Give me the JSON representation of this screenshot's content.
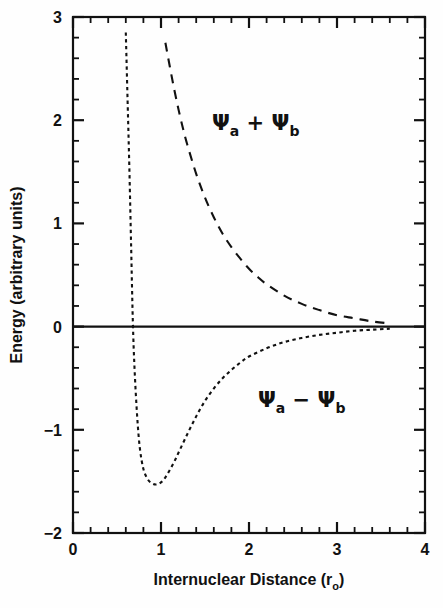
{
  "chart_data": {
    "type": "line",
    "title": "",
    "xlabel": "Internuclear Distance (r",
    "xlabel_sub": "o",
    "xlabel_tail": ")",
    "ylabel": "Energy (arbitrary units)",
    "xlim": [
      0,
      4
    ],
    "ylim": [
      -2,
      3
    ],
    "xticks": [
      "0",
      "1",
      "2",
      "3",
      "4"
    ],
    "xtick_values": [
      0,
      1,
      2,
      3,
      4
    ],
    "yticks": [
      "3",
      "2",
      "1",
      "0",
      "−1",
      "−2"
    ],
    "ytick_values": [
      3,
      2,
      1,
      0,
      -1,
      -2
    ],
    "minor_tick_step": 0.2,
    "grid": false,
    "legend": "none",
    "zero_line": 0,
    "annotations": [
      {
        "id": "antibonding-label",
        "text_psi": "Ψ",
        "sub_a": "a",
        "operator": "+",
        "sub_b": "b",
        "full_text": "Ψa + Ψb",
        "x": 2.0,
        "y": 2.05
      },
      {
        "id": "bonding-label",
        "text_psi": "Ψ",
        "sub_a": "a",
        "operator": "−",
        "sub_b": "b",
        "full_text": "Ψa − Ψb",
        "x": 2.55,
        "y": -1.02
      }
    ],
    "series": [
      {
        "name": "Ψa + Ψb",
        "style": "dashed-long",
        "description": "antibonding molecular orbital energy curve, repulsive, monotonically decreasing toward zero",
        "x": [
          1.05,
          1.1,
          1.15,
          1.2,
          1.25,
          1.3,
          1.4,
          1.5,
          1.6,
          1.7,
          1.8,
          1.9,
          2.0,
          2.1,
          2.2,
          2.4,
          2.6,
          2.8,
          3.0,
          3.2,
          3.4,
          3.6
        ],
        "y": [
          2.75,
          2.52,
          2.3,
          2.1,
          1.92,
          1.76,
          1.48,
          1.25,
          1.06,
          0.9,
          0.77,
          0.66,
          0.56,
          0.48,
          0.41,
          0.3,
          0.22,
          0.16,
          0.11,
          0.08,
          0.05,
          0.03
        ]
      },
      {
        "name": "Ψa − Ψb",
        "style": "dotted-short",
        "description": "bonding molecular orbital energy curve, Morse-like potential well with minimum at r = 1.0 r0",
        "x": [
          0.6,
          0.62,
          0.64,
          0.66,
          0.68,
          0.7,
          0.73,
          0.76,
          0.8,
          0.85,
          0.9,
          0.95,
          1.0,
          1.05,
          1.1,
          1.15,
          1.2,
          1.3,
          1.4,
          1.5,
          1.6,
          1.7,
          1.8,
          1.9,
          2.0,
          2.2,
          2.4,
          2.6,
          2.8,
          3.0,
          3.2,
          3.4,
          3.6
        ],
        "y": [
          2.85,
          2.2,
          1.55,
          0.8,
          0.05,
          -0.42,
          -0.88,
          -1.18,
          -1.38,
          -1.48,
          -1.52,
          -1.53,
          -1.51,
          -1.46,
          -1.39,
          -1.31,
          -1.22,
          -1.04,
          -0.87,
          -0.72,
          -0.6,
          -0.5,
          -0.42,
          -0.35,
          -0.29,
          -0.21,
          -0.15,
          -0.11,
          -0.08,
          -0.06,
          -0.04,
          -0.03,
          -0.02
        ]
      }
    ],
    "key_points": {
      "bonding_minimum_x": 1.0,
      "bonding_minimum_y": -1.52,
      "bonding_zero_crossing_x": 0.68,
      "antibonding_start_x": 1.05,
      "antibonding_start_y": 2.75,
      "curves_end_x": 3.6
    },
    "colors": {
      "axis": "#111111",
      "curve": "#111111",
      "background": "#fefefe",
      "zero_line": "#111111"
    }
  }
}
